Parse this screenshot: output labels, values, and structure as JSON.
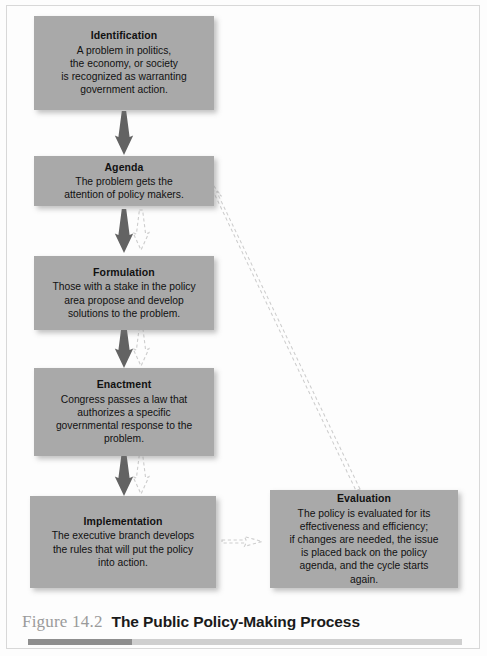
{
  "figure": {
    "label": "Figure 14.2",
    "title": "The Public Policy-Making Process",
    "accent_color": "#8e8e8e",
    "rule_color": "#cfcfcf"
  },
  "colors": {
    "box_fill": "#a9a9a9",
    "box_text": "#111111",
    "solid_arrow": "#606060",
    "dashed_arrow": "#c9c9c9",
    "page_background": "#ffffff"
  },
  "stages": [
    {
      "id": "identification",
      "title": "Identification",
      "body": "A problem in politics,\nthe economy, or society\nis recognized as warranting\ngovernment action."
    },
    {
      "id": "agenda",
      "title": "Agenda",
      "body": "The problem gets the\nattention of policy makers."
    },
    {
      "id": "formulation",
      "title": "Formulation",
      "body": "Those with a stake in the policy\narea propose and develop\nsolutions to the problem."
    },
    {
      "id": "enactment",
      "title": "Enactment",
      "body": "Congress passes a law that\nauthorizes a specific\ngovernmental response to the\nproblem."
    },
    {
      "id": "implementation",
      "title": "Implementation",
      "body": "The executive branch develops\nthe rules that will put the policy\ninto action."
    },
    {
      "id": "evaluation",
      "title": "Evaluation",
      "body": "The policy is evaluated for its\neffectiveness and efficiency;\nif changes are needed, the issue\nis placed back on the policy\nagenda, and the cycle starts\nagain."
    }
  ],
  "connectors": [
    {
      "id": "identification-to-agenda",
      "from": "identification",
      "to": "agenda",
      "style": "solid",
      "direction": "down"
    },
    {
      "id": "agenda-to-formulation",
      "from": "agenda",
      "to": "formulation",
      "style": "solid",
      "direction": "down"
    },
    {
      "id": "formulation-to-enactment",
      "from": "formulation",
      "to": "enactment",
      "style": "solid",
      "direction": "down"
    },
    {
      "id": "enactment-to-implementation",
      "from": "enactment",
      "to": "implementation",
      "style": "solid",
      "direction": "down"
    },
    {
      "id": "agenda-feedback",
      "from": "agenda",
      "to": "formulation",
      "style": "dashed",
      "direction": "down"
    },
    {
      "id": "formulation-feedback",
      "from": "formulation",
      "to": "enactment",
      "style": "dashed",
      "direction": "down"
    },
    {
      "id": "enactment-feedback",
      "from": "enactment",
      "to": "implementation",
      "style": "dashed",
      "direction": "down"
    },
    {
      "id": "implementation-to-evaluation",
      "from": "implementation",
      "to": "evaluation",
      "style": "dashed",
      "direction": "right"
    },
    {
      "id": "evaluation-to-agenda",
      "from": "evaluation",
      "to": "agenda",
      "style": "dashed",
      "direction": "diagonal-up-left"
    }
  ]
}
